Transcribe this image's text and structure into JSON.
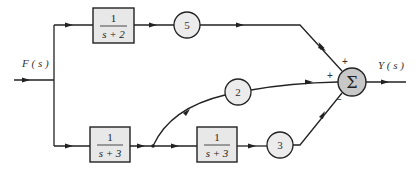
{
  "diagram": {
    "type": "block-diagram",
    "input_label": "F ( s )",
    "output_label": "Y ( s )",
    "blocks": [
      {
        "id": "top-tf",
        "numerator": "1",
        "denominator": "s + 2"
      },
      {
        "id": "bottom-tf-1",
        "numerator": "1",
        "denominator": "s + 3"
      },
      {
        "id": "bottom-tf-2",
        "numerator": "1",
        "denominator": "s + 3"
      }
    ],
    "gains": [
      {
        "id": "gain-5",
        "value": "5"
      },
      {
        "id": "gain-2",
        "value": "2"
      },
      {
        "id": "gain-3",
        "value": "3"
      }
    ],
    "summing_junction": {
      "symbol": "Σ",
      "signs": {
        "top": "+",
        "left": "+",
        "bottom": "−"
      }
    },
    "colors": {
      "block_fill": "#e8e8e8",
      "sum_fill": "#c8c8c8",
      "line": "#222222"
    }
  }
}
